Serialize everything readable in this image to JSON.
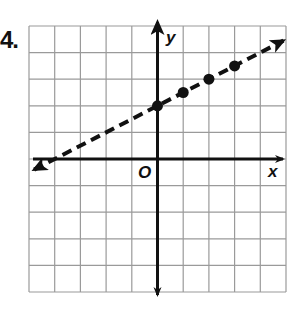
{
  "problem": {
    "number": "4."
  },
  "chart_data": {
    "type": "line",
    "title": "",
    "xlabel": "x",
    "ylabel": "y",
    "origin_label": "O",
    "xlim": [
      -5,
      5
    ],
    "ylim": [
      -5,
      5
    ],
    "grid": true,
    "tick_labels": false,
    "line": {
      "style": "dashed",
      "equation": "y = 0.5x + 2",
      "slope": 0.5,
      "y_intercept": 2,
      "x_range": [
        -4.8,
        4.9
      ],
      "arrows": "both"
    },
    "points": [
      {
        "x": 0,
        "y": 2
      },
      {
        "x": 1,
        "y": 2.5
      },
      {
        "x": 2,
        "y": 3
      },
      {
        "x": 3,
        "y": 3.5
      }
    ]
  },
  "colors": {
    "grid": "#9a9a9a",
    "axes": "#111111",
    "line": "#111111",
    "points": "#111111"
  }
}
